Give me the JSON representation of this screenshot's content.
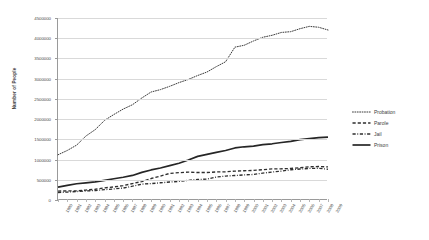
{
  "chart_data": {
    "type": "line",
    "title": "",
    "xlabel": "",
    "ylabel": "Number of People",
    "ylim": [
      0,
      4500000
    ],
    "ytick_values": [
      0,
      500000,
      1000000,
      1500000,
      2000000,
      2500000,
      3000000,
      3500000,
      4000000,
      4500000
    ],
    "ytick_labels": [
      "0",
      "500000",
      "1000000",
      "1500000",
      "2000000",
      "2500000",
      "3000000",
      "3500000",
      "4000000",
      "4500000"
    ],
    "grid": "horizontal",
    "legend_position": "right",
    "categories": [
      "1980",
      "1981",
      "1982",
      "1983",
      "1984",
      "1985",
      "1986",
      "1987",
      "1988",
      "1989",
      "1990",
      "1991",
      "1992",
      "1993",
      "1994",
      "1995",
      "1996",
      "1997",
      "1998",
      "1999",
      "2000",
      "2001",
      "2002",
      "2003",
      "2004",
      "2005",
      "2006",
      "2007",
      "2008",
      "2009"
    ],
    "series": [
      {
        "name": "Probation",
        "style": "dotted",
        "color": "#3b3b3b",
        "values": [
          1118000,
          1225000,
          1357000,
          1582000,
          1740000,
          1969000,
          2114000,
          2248000,
          2356000,
          2522000,
          2670000,
          2729000,
          2811000,
          2903000,
          2981000,
          3078000,
          3164000,
          3297000,
          3418000,
          3779000,
          3826000,
          3932000,
          4024000,
          4073000,
          4143000,
          4162000,
          4236000,
          4293000,
          4271000,
          4203000
        ]
      },
      {
        "name": "Parole",
        "style": "dashed",
        "color": "#2e2e2e",
        "values": [
          220000,
          225000,
          224000,
          246000,
          266000,
          300000,
          325000,
          355000,
          407000,
          456000,
          531000,
          590000,
          658000,
          676000,
          690000,
          679000,
          679000,
          694000,
          696000,
          714000,
          724000,
          732000,
          750000,
          769000,
          772000,
          780000,
          798000,
          821000,
          828000,
          819000
        ]
      },
      {
        "name": "Jail",
        "style": "dashdot",
        "color": "#2e2e2e",
        "values": [
          182000,
          196000,
          209000,
          223000,
          234000,
          256000,
          274000,
          295000,
          341000,
          393000,
          405000,
          426000,
          444000,
          459000,
          486000,
          507000,
          518000,
          567000,
          592000,
          605000,
          621000,
          631000,
          665000,
          691000,
          714000,
          747000,
          766000,
          780000,
          785000,
          760000
        ]
      },
      {
        "name": "Prison",
        "style": "solid",
        "color": "#262626",
        "values": [
          320000,
          360000,
          402000,
          423000,
          448000,
          487000,
          526000,
          562000,
          607000,
          683000,
          743000,
          792000,
          850000,
          909000,
          990000,
          1078000,
          1127000,
          1176000,
          1224000,
          1287000,
          1316000,
          1330000,
          1367000,
          1390000,
          1421000,
          1448000,
          1492000,
          1517000,
          1540000,
          1555000
        ]
      }
    ]
  },
  "legend": {
    "items": [
      {
        "label": "Probation",
        "key": "dotted-line-key"
      },
      {
        "label": "Parole",
        "key": "dashed-line-key"
      },
      {
        "label": "Jail",
        "key": "dashdot-line-key"
      },
      {
        "label": "Prison",
        "key": "solid-line-key"
      }
    ]
  }
}
